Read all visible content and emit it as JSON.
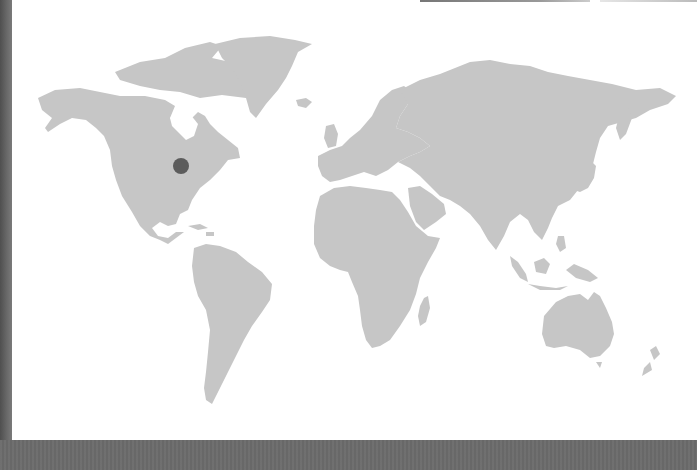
{
  "map": {
    "type": "world-map",
    "land_color": "#c6c6c6",
    "ocean_color": "#ffffff",
    "frame_color": "#6b6b6b",
    "marker": {
      "label": "",
      "region": "United States - Midwest",
      "x": 181,
      "y": 166,
      "radius": 8,
      "color": "#5c5c5c"
    },
    "continents": [
      "North America",
      "Greenland",
      "South America",
      "Europe",
      "Africa",
      "Asia",
      "Australia",
      "New Zealand",
      "Madagascar",
      "Indonesia"
    ]
  }
}
